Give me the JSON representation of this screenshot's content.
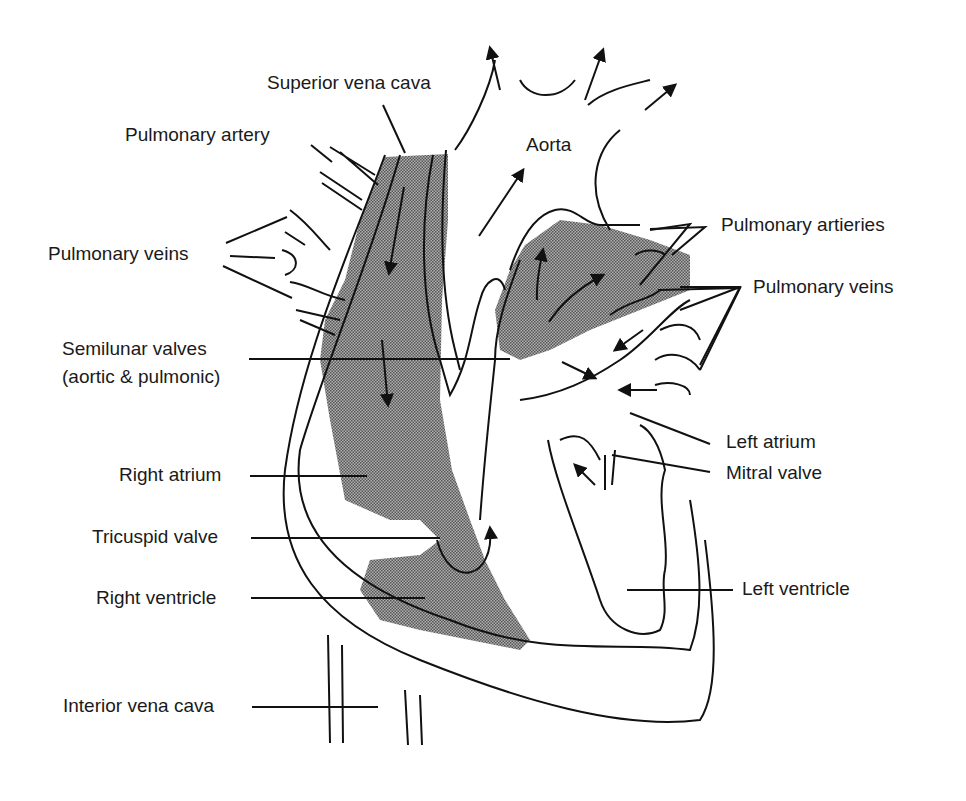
{
  "diagram": {
    "colors": {
      "line": "#111111",
      "deoxygenated_fill": "#8c8c8c",
      "background": "#ffffff"
    },
    "labels": {
      "superior_vena_cava": "Superior vena cava",
      "pulmonary_artery": "Pulmonary artery",
      "pulmonary_veins_left": "Pulmonary veins",
      "semilunar_valves_1": "Semilunar valves",
      "semilunar_valves_2": "(aortic & pulmonic)",
      "right_atrium": "Right atrium",
      "tricuspid_valve": "Tricuspid valve",
      "right_ventricle": "Right ventricle",
      "interior_vena_cava": "Interior vena cava",
      "aorta": "Aorta",
      "pulmonary_artieries": "Pulmonary artieries",
      "pulmonary_veins_right": "Pulmonary veins",
      "left_atrium": "Left atrium",
      "mitral_valve": "Mitral valve",
      "left_ventricle": "Left ventricle"
    }
  }
}
